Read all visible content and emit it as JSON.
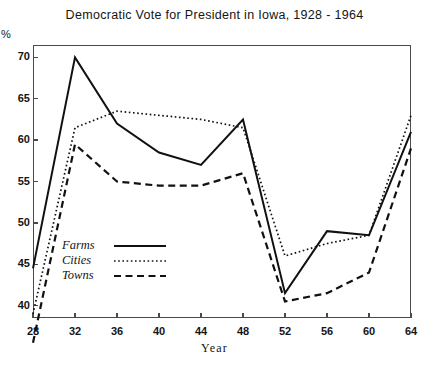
{
  "chart_data": {
    "type": "line",
    "title": "Democratic Vote for President in Iowa, 1928 - 1964",
    "xlabel": "Year",
    "ylabel": "%",
    "x": [
      28,
      32,
      36,
      40,
      44,
      48,
      52,
      56,
      60,
      64
    ],
    "xticklabels": [
      "28",
      "32",
      "36",
      "40",
      "44",
      "48",
      "52",
      "56",
      "60",
      "64"
    ],
    "yticks": [
      40,
      45,
      50,
      55,
      60,
      65,
      70
    ],
    "yticklabels": [
      "40",
      "45",
      "50",
      "55",
      "60",
      "65",
      "70"
    ],
    "xlim": [
      28,
      64
    ],
    "ylim": [
      38.5,
      71.5
    ],
    "grid": false,
    "legend_position": "lower-left-inside",
    "series": [
      {
        "name": "Farms",
        "style": "solid",
        "values": [
          44.5,
          70.0,
          62.0,
          58.5,
          57.0,
          62.5,
          41.5,
          49.0,
          48.5,
          61.0
        ]
      },
      {
        "name": "Cities",
        "style": "dotted",
        "values": [
          39.0,
          61.5,
          63.5,
          63.0,
          62.5,
          61.5,
          46.0,
          47.5,
          48.5,
          63.0
        ]
      },
      {
        "name": "Towns",
        "style": "dashed",
        "values": [
          35.5,
          59.5,
          55.0,
          54.5,
          54.5,
          56.0,
          40.5,
          41.5,
          44.0,
          59.0
        ]
      }
    ]
  }
}
